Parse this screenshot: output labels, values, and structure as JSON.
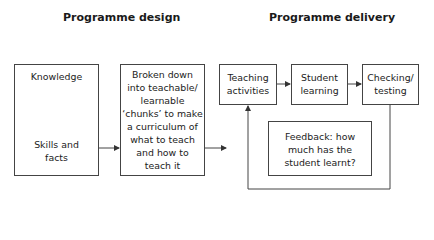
{
  "headings": {
    "design": "Programme design",
    "delivery": "Programme delivery"
  },
  "boxes": {
    "knowledge": {
      "top": "Knowledge",
      "bottom_line1": "Skills and",
      "bottom_line2": "facts"
    },
    "chunks": {
      "lines": [
        "Broken down",
        "into teachable/",
        "learnable",
        "‘chunks’ to make",
        "a curriculum of",
        "what to teach",
        "and how to",
        "teach it"
      ]
    },
    "teaching": {
      "lines": [
        "Teaching",
        "activities"
      ]
    },
    "student": {
      "lines": [
        "Student",
        "learning"
      ]
    },
    "checking": {
      "lines": [
        "Checking/",
        "testing"
      ]
    },
    "feedback": {
      "lines": [
        "Feedback: how",
        "much has the",
        "student learnt?"
      ]
    }
  },
  "colors": {
    "line": "#444444",
    "text": "#222222"
  }
}
